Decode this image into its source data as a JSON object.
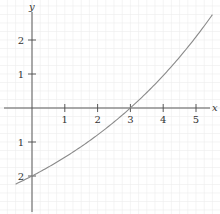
{
  "chart_data": {
    "type": "line",
    "title": "",
    "xlabel": "x",
    "ylabel": "y",
    "xlim": [
      -0.52,
      5.55
    ],
    "ylim": [
      -3.1,
      3.15
    ],
    "grid": true,
    "legend": null,
    "x_ticks": [
      1,
      2,
      3,
      4,
      5
    ],
    "x_tick_labels": [
      "1",
      "2",
      "3",
      "4",
      "5"
    ],
    "y_ticks": [
      2,
      1,
      -1,
      -2
    ],
    "y_tick_labels": [
      "2",
      "1",
      "1",
      "2"
    ],
    "series": [
      {
        "name": "curve",
        "x": [
          -0.5,
          0,
          0.5,
          1,
          1.5,
          2,
          2.5,
          3,
          3.5,
          4,
          4.5,
          5,
          5.5
        ],
        "y": [
          -2.24,
          -2.0,
          -1.74,
          -1.45,
          -1.14,
          -0.79,
          -0.42,
          0.0,
          0.46,
          0.95,
          1.49,
          2.09,
          2.74
        ]
      }
    ]
  },
  "colors": {
    "axis": "#4a4a4a",
    "grid": "#ececec",
    "curve": "#8a8a8a",
    "text": "#333333"
  }
}
